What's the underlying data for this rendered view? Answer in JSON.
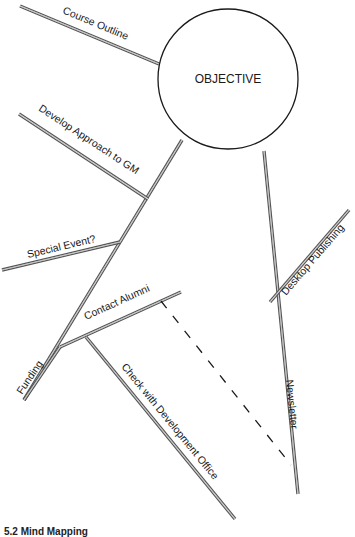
{
  "diagram": {
    "type": "mind-map",
    "center": {
      "label": "OBJECTIVE",
      "cx": 228,
      "cy": 79,
      "r": 70
    },
    "branches": [
      {
        "id": "course-outline",
        "label": "Course Outline",
        "x1": 20,
        "y1": 6,
        "x2": 159,
        "y2": 64,
        "text_x": 62,
        "text_y": 13,
        "angle": 22.6
      },
      {
        "id": "main-left",
        "label": "",
        "x1": 182,
        "y1": 140,
        "x2": 24,
        "y2": 400,
        "text_x": 0,
        "text_y": 0,
        "angle": 0
      },
      {
        "id": "develop-approach",
        "label": "Develop Approach to GM",
        "x1": 19,
        "y1": 114,
        "x2": 148,
        "y2": 199,
        "text_x": 38,
        "text_y": 110,
        "angle": 33.4
      },
      {
        "id": "special-event",
        "label": "Special Event?",
        "x1": 2,
        "y1": 270,
        "x2": 120,
        "y2": 242,
        "text_x": 28,
        "text_y": 258,
        "angle": -13.3
      },
      {
        "id": "funding",
        "label": "Funding",
        "x1": 60,
        "y1": 347,
        "x2": 24,
        "y2": 400,
        "text_x": 22,
        "text_y": 395,
        "angle": -56
      },
      {
        "id": "contact-alumni",
        "label": "Contact Alumni",
        "x1": 60,
        "y1": 347,
        "x2": 181,
        "y2": 292,
        "text_x": 86,
        "text_y": 320,
        "angle": -24.4
      },
      {
        "id": "check-dev-office",
        "label": "Check with Development Office",
        "x1": 86,
        "y1": 337,
        "x2": 235,
        "y2": 519,
        "text_x": 121,
        "text_y": 367,
        "angle": 50.7
      },
      {
        "id": "newsletter",
        "label": "Newsletter",
        "x1": 264,
        "y1": 151,
        "x2": 298,
        "y2": 494,
        "text_x": 286,
        "text_y": 380,
        "angle": 84.3
      },
      {
        "id": "desktop-publishing",
        "label": "Desktop Publishing",
        "x1": 270,
        "y1": 302,
        "x2": 349,
        "y2": 210,
        "text_x": 286,
        "text_y": 296,
        "angle": -49.3
      }
    ],
    "dashed_link": {
      "from": "contact-alumni",
      "to": "newsletter",
      "x1": 161,
      "y1": 301,
      "x2": 291,
      "y2": 465
    },
    "caption": "5.2 Mind Mapping"
  },
  "colors": {
    "line": "#555555",
    "text": "#1a1a1a",
    "background": "#ffffff"
  }
}
